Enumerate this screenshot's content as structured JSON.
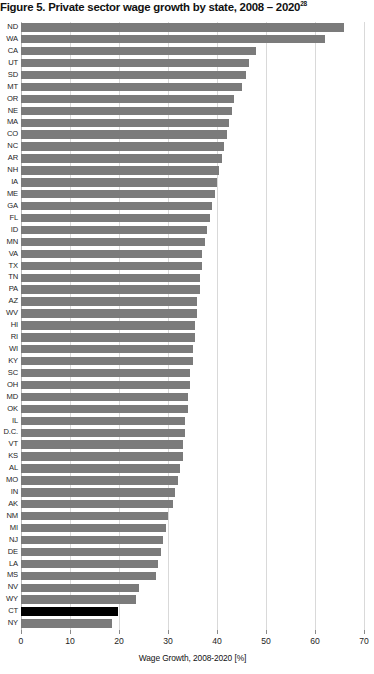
{
  "figure": {
    "title": "Figure 5. Private sector wage growth by state, 2008 – 2020",
    "title_superscript": "28"
  },
  "chart_data": {
    "type": "bar",
    "orientation": "horizontal",
    "title": "Figure 5. Private sector wage growth by state, 2008 – 2020",
    "xlabel": "Wage Growth, 2008-2020 [%]",
    "ylabel": "",
    "xlim": [
      0,
      70
    ],
    "xticks": [
      0,
      10,
      20,
      30,
      40,
      50,
      60,
      70
    ],
    "grid": "vertical",
    "legend": "none",
    "bar_color": "#7b7b7b",
    "highlight_color": "#000000",
    "highlight_category": "CT",
    "categories": [
      "ND",
      "WA",
      "CA",
      "UT",
      "SD",
      "MT",
      "OR",
      "NE",
      "MA",
      "CO",
      "NC",
      "AR",
      "NH",
      "IA",
      "ME",
      "GA",
      "FL",
      "ID",
      "MN",
      "VA",
      "TX",
      "TN",
      "PA",
      "AZ",
      "WV",
      "HI",
      "RI",
      "WI",
      "KY",
      "SC",
      "OH",
      "MD",
      "OK",
      "IL",
      "D.C.",
      "VT",
      "KS",
      "AL",
      "MO",
      "IN",
      "AK",
      "NM",
      "MI",
      "NJ",
      "DE",
      "LA",
      "MS",
      "NV",
      "WY",
      "CT",
      "NY"
    ],
    "values": [
      66.0,
      62.0,
      48.0,
      46.5,
      46.0,
      45.0,
      43.5,
      43.0,
      42.5,
      42.0,
      41.5,
      41.0,
      40.5,
      40.0,
      39.5,
      39.0,
      38.5,
      38.0,
      37.5,
      37.0,
      37.0,
      36.5,
      36.5,
      36.0,
      36.0,
      35.5,
      35.5,
      35.0,
      35.0,
      34.5,
      34.5,
      34.0,
      34.0,
      33.5,
      33.5,
      33.0,
      33.0,
      32.5,
      32.0,
      31.5,
      31.0,
      30.0,
      29.5,
      29.0,
      28.5,
      28.0,
      27.5,
      24.0,
      23.5,
      19.7,
      18.5
    ]
  }
}
